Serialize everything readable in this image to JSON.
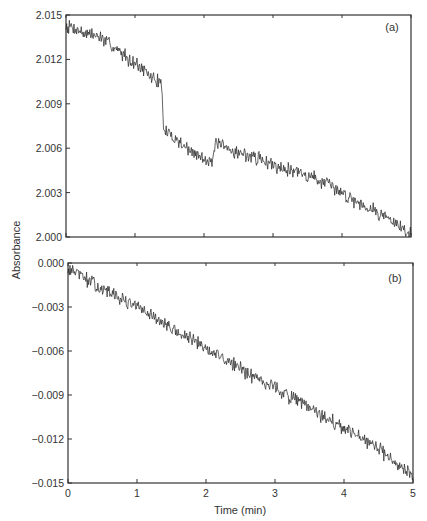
{
  "figure": {
    "ylabel": "Absorbance",
    "xlabel": "Time (min)",
    "x_ticks": [
      "0",
      "1",
      "2",
      "3",
      "4",
      "5"
    ]
  },
  "chart_data": [
    {
      "type": "line",
      "panel_label": "(a)",
      "title": "",
      "xlabel": "Time (min)",
      "ylabel": "Absorbance",
      "xlim": [
        0,
        5
      ],
      "ylim": [
        2.0,
        2.015
      ],
      "x_ticks": [
        0,
        1,
        2,
        3,
        4,
        5
      ],
      "y_ticks": [
        "2.000",
        "2.003",
        "2.006",
        "2.009",
        "2.012",
        "2.015"
      ],
      "grid": false,
      "legend": null,
      "series": [
        {
          "name": "Absorbance (a)",
          "noise_amplitude": 0.0004,
          "x": [
            0,
            0.1,
            0.25,
            0.5,
            0.75,
            1.0,
            1.2,
            1.39,
            1.41,
            1.6,
            1.8,
            2.0,
            2.14,
            2.16,
            2.3,
            2.5,
            2.8,
            3.0,
            3.3,
            3.6,
            4.0,
            4.3,
            4.6,
            4.8,
            5.0
          ],
          "y": [
            2.0143,
            2.0142,
            2.0138,
            2.0135,
            2.0126,
            2.0118,
            2.0109,
            2.0104,
            2.0072,
            2.0066,
            2.0058,
            2.0053,
            2.0052,
            2.0063,
            2.006,
            2.0057,
            2.0053,
            2.0049,
            2.0045,
            2.004,
            2.003,
            2.0022,
            2.0015,
            2.0008,
            2.0002
          ]
        }
      ],
      "annotations": [
        "step drop near t=1.4 min",
        "small jump near t=2.15 min"
      ]
    },
    {
      "type": "line",
      "panel_label": "(b)",
      "title": "",
      "xlabel": "Time (min)",
      "ylabel": "Absorbance",
      "xlim": [
        0,
        5
      ],
      "ylim": [
        -0.015,
        0.0
      ],
      "x_ticks": [
        0,
        1,
        2,
        3,
        4,
        5
      ],
      "y_ticks": [
        "-0.015",
        "-0.012",
        "-0.009",
        "-0.006",
        "-0.003",
        "0.000"
      ],
      "grid": false,
      "legend": null,
      "series": [
        {
          "name": "Absorbance (b)",
          "noise_amplitude": 0.0004,
          "x": [
            0,
            0.1,
            0.5,
            1.0,
            1.5,
            2.0,
            2.5,
            3.0,
            3.5,
            4.0,
            4.5,
            4.8,
            5.0
          ],
          "y": [
            -0.0005,
            -0.0006,
            -0.0018,
            -0.003,
            -0.0045,
            -0.0058,
            -0.0072,
            -0.0085,
            -0.0099,
            -0.0113,
            -0.0127,
            -0.0137,
            -0.0145
          ]
        }
      ]
    }
  ]
}
